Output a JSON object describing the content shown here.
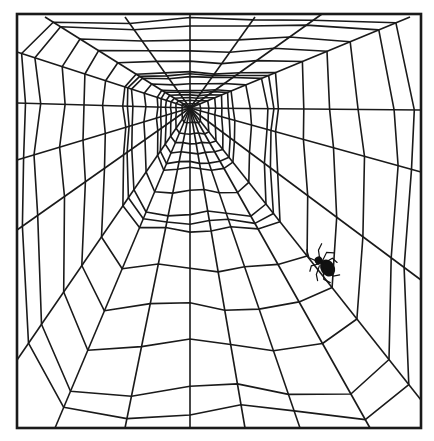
{
  "illustration": {
    "subject": "Spider web with a spider",
    "colors": {
      "background": "#ffffff",
      "line": "#1a1a1a",
      "spider": "#111111"
    },
    "frame": {
      "x": 17,
      "y": 14,
      "width": 404,
      "height": 414,
      "stroke_width": 2.6
    },
    "hub": {
      "x": 190,
      "y": 108
    },
    "radials": [
      [
        190,
        14
      ],
      [
        255,
        17
      ],
      [
        322,
        14
      ],
      [
        410,
        17
      ],
      [
        421,
        110
      ],
      [
        421,
        172
      ],
      [
        421,
        280
      ],
      [
        421,
        400
      ],
      [
        370,
        428
      ],
      [
        300,
        428
      ],
      [
        245,
        428
      ],
      [
        190,
        428
      ],
      [
        125,
        428
      ],
      [
        55,
        428
      ],
      [
        17,
        360
      ],
      [
        17,
        230
      ],
      [
        17,
        160
      ],
      [
        17,
        103
      ],
      [
        17,
        52
      ],
      [
        45,
        17
      ],
      [
        125,
        17
      ]
    ],
    "rings": [
      0.045,
      0.08,
      0.11,
      0.14,
      0.17,
      0.19,
      0.26,
      0.33,
      0.355,
      0.38,
      0.5,
      0.62,
      0.74,
      0.88,
      0.95
    ],
    "spider": {
      "x": 323,
      "y": 266,
      "scale": 1
    }
  }
}
